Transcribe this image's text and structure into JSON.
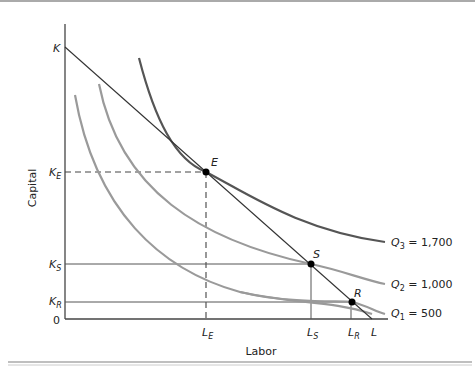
{
  "figure": {
    "x_axis_label": "Labor",
    "y_axis_label": "Capital",
    "origin_label": "0",
    "y_ticks": [
      {
        "id": "K",
        "base": "K",
        "sub": ""
      },
      {
        "id": "KE",
        "base": "K",
        "sub": "E"
      },
      {
        "id": "KS",
        "base": "K",
        "sub": "S"
      },
      {
        "id": "KR",
        "base": "K",
        "sub": "R"
      }
    ],
    "x_ticks": [
      {
        "id": "LE",
        "base": "L",
        "sub": "E"
      },
      {
        "id": "LS",
        "base": "L",
        "sub": "S"
      },
      {
        "id": "LR",
        "base": "L",
        "sub": "R"
      },
      {
        "id": "L",
        "base": "L",
        "sub": ""
      }
    ],
    "points": [
      {
        "id": "E",
        "label": "E"
      },
      {
        "id": "S",
        "label": "S"
      },
      {
        "id": "R",
        "label": "R"
      }
    ],
    "isoquants": [
      {
        "id": "Q3",
        "label_base": "Q",
        "label_sub": "3",
        "label_value": " = 1,700",
        "color": "#555555"
      },
      {
        "id": "Q2",
        "label_base": "Q",
        "label_sub": "2",
        "label_value": " = 1,000",
        "color": "#9a9a9a"
      },
      {
        "id": "Q1",
        "label_base": "Q",
        "label_sub": "1",
        "label_value": " = 500",
        "color": "#9a9a9a"
      }
    ],
    "isocost_line": {
      "from": "K",
      "to": "L",
      "color": "#333333"
    },
    "colors": {
      "axis": "#444444",
      "border": "#aaaaaa",
      "point": "#000000"
    }
  }
}
